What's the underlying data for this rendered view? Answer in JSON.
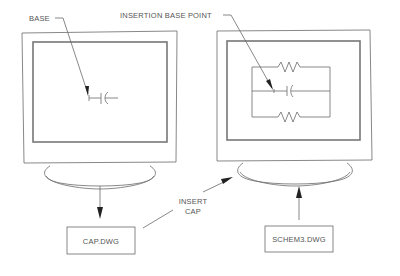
{
  "diagram": {
    "type": "block-diagram",
    "left_monitor": {
      "label": "BASE",
      "content": "capacitor symbol"
    },
    "right_monitor": {
      "label": "INSERTION BASE POINT",
      "content": "circuit with two resistors and capacitor"
    },
    "files": {
      "source": "CAP.DWG",
      "target": "SCHEM3.DWG"
    },
    "action": {
      "line1": "INSERT",
      "line2": "CAP"
    },
    "colors": {
      "line": "#6a6a6a",
      "text": "#555555",
      "arrow": "#222222",
      "background": "#ffffff"
    }
  }
}
